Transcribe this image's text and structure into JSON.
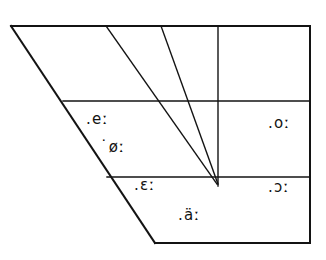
{
  "figure": {
    "kind": "vowel-quadrilateral",
    "background_color": "#ffffff",
    "ink_color": "#131313"
  },
  "chart_data": {
    "type": "scatter",
    "title": "",
    "xlabel": "",
    "ylabel": "",
    "grid": true,
    "legend": null,
    "xlim": [
      0,
      326
    ],
    "ylim": [
      260,
      0
    ],
    "annotations": [
      {
        "id": "close-front",
        "text": ".eː",
        "symbol": "e",
        "x": 100,
        "y": 120,
        "row": "close-mid",
        "column": "front"
      },
      {
        "id": "close-front-rounded",
        "text": "˙øː",
        "symbol": "ø",
        "x": 116,
        "y": 148,
        "row": "close-mid",
        "column": "front-rounded"
      },
      {
        "id": "close-back-rounded",
        "text": ".oː",
        "symbol": "o",
        "x": 281,
        "y": 124,
        "row": "close-mid",
        "column": "back"
      },
      {
        "id": "open-front",
        "text": ".ɛː",
        "symbol": "ɛ",
        "x": 148,
        "y": 186,
        "row": "open-mid",
        "column": "front"
      },
      {
        "id": "open-back-rounded",
        "text": ".ɔː",
        "symbol": "ɔ",
        "x": 281,
        "y": 188,
        "row": "open-mid",
        "column": "back"
      },
      {
        "id": "open-central",
        "text": ".äː",
        "symbol": "ä",
        "x": 192,
        "y": 216,
        "row": "open",
        "column": "central"
      }
    ],
    "lines": [
      {
        "id": "top-edge",
        "role": "close-boundary",
        "points": [
          [
            11,
            26
          ],
          [
            310,
            26
          ]
        ]
      },
      {
        "id": "right-edge",
        "role": "back-boundary",
        "points": [
          [
            310,
            26
          ],
          [
            310,
            242
          ]
        ]
      },
      {
        "id": "bottom-edge",
        "role": "open-boundary",
        "points": [
          [
            155,
            243
          ],
          [
            310,
            243
          ]
        ]
      },
      {
        "id": "left-edge",
        "role": "front-boundary",
        "points": [
          [
            11,
            26
          ],
          [
            155,
            243
          ]
        ]
      },
      {
        "id": "divider-close-mid",
        "role": "horizontal-divider",
        "points": [
          [
            63,
            101
          ],
          [
            310,
            101
          ]
        ]
      },
      {
        "id": "divider-open-mid",
        "role": "horizontal-divider",
        "points": [
          [
            107,
            177
          ],
          [
            310,
            177
          ]
        ]
      },
      {
        "id": "converging-line-1",
        "role": "vertical-divider",
        "points": [
          [
            106,
            26
          ],
          [
            217,
            184
          ]
        ]
      },
      {
        "id": "converging-line-2",
        "role": "vertical-divider",
        "points": [
          [
            161,
            26
          ],
          [
            218,
            184
          ]
        ]
      },
      {
        "id": "converging-line-3",
        "role": "vertical-divider",
        "points": [
          [
            218,
            26
          ],
          [
            218,
            186
          ]
        ]
      }
    ]
  }
}
